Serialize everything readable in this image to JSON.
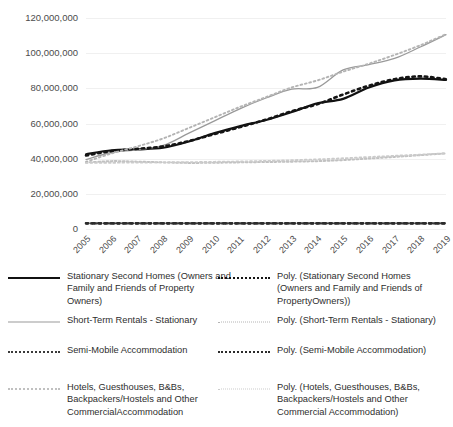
{
  "chart_data": {
    "type": "line",
    "title": "",
    "xlabel": "",
    "ylabel": "",
    "x": [
      2005,
      2006,
      2007,
      2008,
      2009,
      2010,
      2011,
      2012,
      2013,
      2014,
      2015,
      2016,
      2017,
      2018,
      2019
    ],
    "xtick_labels": [
      "2005",
      "2006",
      "2007",
      "2008",
      "2009",
      "2010",
      "2011",
      "2012",
      "2013",
      "2014",
      "2015",
      "2016",
      "2017",
      "2018",
      "2019"
    ],
    "ylim": [
      0,
      120000000
    ],
    "ytick_values": [
      0,
      20000000,
      40000000,
      60000000,
      80000000,
      100000000,
      120000000
    ],
    "ytick_labels": [
      "0",
      "20,000,000",
      "40,000,000",
      "60,000,000",
      "80,000,000",
      "100,000,000",
      "120,000,000"
    ],
    "grid": true,
    "legend_position": "bottom",
    "series": [
      {
        "name": "Stationary Second Homes (Owners and Family and Friends of Property Owners)",
        "style": "solid",
        "color": "#111111",
        "width": 2.2,
        "values": [
          42500000,
          44800000,
          45300000,
          46200000,
          49800000,
          54500000,
          58500000,
          62000000,
          66500000,
          71500000,
          74000000,
          80500000,
          84500000,
          85500000,
          84800000
        ]
      },
      {
        "name": "Short-Term Rentals - Stationary",
        "style": "solid",
        "color": "#9a9a9a",
        "width": 1.3,
        "values": [
          39500000,
          43500000,
          45000000,
          47500000,
          54500000,
          61500000,
          68500000,
          74500000,
          79500000,
          80500000,
          90500000,
          93500000,
          97000000,
          103500000,
          110500000
        ]
      },
      {
        "name": "Semi-Mobile Accommodation",
        "style": "dotted",
        "color": "#3a3a3a",
        "width": 2.2,
        "values": [
          3200000,
          3200000,
          3200000,
          3200000,
          3200000,
          3200000,
          3200000,
          3200000,
          3200000,
          3200000,
          3200000,
          3200000,
          3200000,
          3200000,
          3200000
        ]
      },
      {
        "name": "Hotels, Guesthouses, B&Bs, Backpackers/Hostels and Other Commercial Accommodation",
        "style": "dotted",
        "color": "#c0c0c0",
        "width": 2,
        "values": [
          37800000,
          38600000,
          38300000,
          37900000,
          37600000,
          37700000,
          37900000,
          38100000,
          38300000,
          38600000,
          39200000,
          40100000,
          41000000,
          42000000,
          43000000
        ]
      },
      {
        "name": "Poly. (Stationary Second Homes (Owners and Family and Friends of PropertyOwners))",
        "style": "poly-dotted",
        "color": "#141414",
        "width": 2.6,
        "values": [
          41800000,
          44300000,
          45600000,
          47000000,
          50000000,
          54000000,
          58000000,
          62200000,
          67000000,
          71000000,
          76500000,
          81500000,
          85200000,
          86800000,
          85200000
        ]
      },
      {
        "name": "Poly. (Short-Term Rentals - Stationary)",
        "style": "poly-dotted",
        "color": "#b4b4b4",
        "width": 1.9,
        "values": [
          38200000,
          43000000,
          47000000,
          51500000,
          57500000,
          63500000,
          69500000,
          75000000,
          80500000,
          84500000,
          89500000,
          94000000,
          99000000,
          104500000,
          110800000
        ]
      },
      {
        "name": "Poly. (Semi-Mobile Accommodation)",
        "style": "poly-dotted",
        "color": "#2b2b2b",
        "width": 2.6,
        "values": [
          3200000,
          3200000,
          3200000,
          3200000,
          3200000,
          3200000,
          3200000,
          3200000,
          3200000,
          3200000,
          3200000,
          3200000,
          3200000,
          3200000,
          3200000
        ]
      },
      {
        "name": "Poly. (Hotels, Guesthouses, B&Bs, Backpackers/Hostels and Other Commercial Accommodation)",
        "style": "poly-dotted",
        "color": "#cbcbcb",
        "width": 1.9,
        "values": [
          37600000,
          37700000,
          37800000,
          37900000,
          38000000,
          38200000,
          38400000,
          38700000,
          39100000,
          39600000,
          40200000,
          40900000,
          41600000,
          42300000,
          43000000
        ]
      }
    ],
    "legend": [
      {
        "label": "Stationary Second Homes (Owners and Family and Friends of Property Owners)",
        "swatch": "solid-black",
        "column": "left"
      },
      {
        "label": "Short-Term Rentals - Stationary",
        "swatch": "solid-grey",
        "column": "left"
      },
      {
        "label": "Semi-Mobile Accommodation",
        "swatch": "dot-dark",
        "column": "left"
      },
      {
        "label": "Hotels, Guesthouses, B&Bs, Backpackers/Hostels and Other CommercialAccommodation",
        "swatch": "dot-light",
        "column": "left"
      },
      {
        "label": "Poly. (Stationary Second Homes (Owners and Family and Friends of PropertyOwners))",
        "swatch": "poly-black",
        "column": "right"
      },
      {
        "label": "Poly. (Short-Term Rentals - Stationary)",
        "swatch": "poly-grey",
        "column": "right"
      },
      {
        "label": "Poly. (Semi-Mobile Accommodation)",
        "swatch": "poly-dark",
        "column": "right"
      },
      {
        "label": "Poly. (Hotels, Guesthouses, B&Bs, Backpackers/Hostels and Other Commercial Accommodation)",
        "swatch": "poly-pale",
        "column": "right"
      }
    ]
  }
}
